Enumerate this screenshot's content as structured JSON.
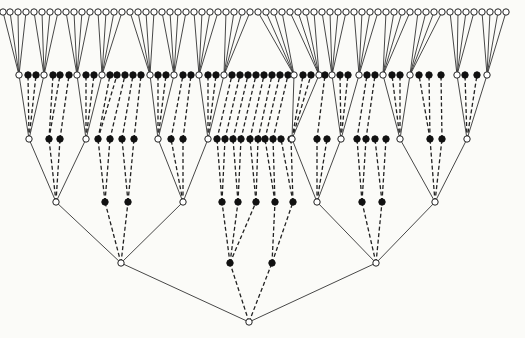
{
  "diagram": {
    "type": "tree",
    "colors": {
      "background": "#fbfbf8",
      "line": "#333333",
      "filled_node": "#111111",
      "open_node": "#ffffff"
    },
    "levels_y": [
      322,
      263,
      202,
      139,
      75,
      12
    ],
    "node_radius": 3.2,
    "root": {
      "x": 249,
      "y": 322
    },
    "level1": [
      {
        "x": 121,
        "t": "o"
      },
      {
        "x": 230,
        "t": "f"
      },
      {
        "x": 272,
        "t": "f"
      },
      {
        "x": 376,
        "t": "o"
      }
    ],
    "level2": [
      {
        "x": 56,
        "t": "o",
        "p": 0
      },
      {
        "x": 105,
        "t": "f",
        "p": 0
      },
      {
        "x": 128,
        "t": "f",
        "p": 0
      },
      {
        "x": 183,
        "t": "o",
        "p": 0
      },
      {
        "x": 222,
        "t": "f",
        "p": 1
      },
      {
        "x": 238,
        "t": "f",
        "p": 1
      },
      {
        "x": 256,
        "t": "f",
        "p": 1
      },
      {
        "x": 275,
        "t": "f",
        "p": 2
      },
      {
        "x": 293,
        "t": "f",
        "p": 2
      },
      {
        "x": 317,
        "t": "o",
        "p": 3
      },
      {
        "x": 362,
        "t": "f",
        "p": 3
      },
      {
        "x": 382,
        "t": "f",
        "p": 3
      },
      {
        "x": 435,
        "t": "o",
        "p": 3
      }
    ],
    "level3": [
      {
        "x": 29,
        "t": "o",
        "p": 0
      },
      {
        "x": 49,
        "t": "f",
        "p": 0
      },
      {
        "x": 60,
        "t": "f",
        "p": 0
      },
      {
        "x": 86,
        "t": "o",
        "p": 0
      },
      {
        "x": 98,
        "t": "f",
        "p": 1
      },
      {
        "x": 110,
        "t": "f",
        "p": 1
      },
      {
        "x": 122,
        "t": "f",
        "p": 2
      },
      {
        "x": 134,
        "t": "f",
        "p": 2
      },
      {
        "x": 158,
        "t": "o",
        "p": 3
      },
      {
        "x": 171,
        "t": "f",
        "p": 3
      },
      {
        "x": 183,
        "t": "f",
        "p": 3
      },
      {
        "x": 208,
        "t": "o",
        "p": 3
      },
      {
        "x": 217,
        "t": "f",
        "p": 4
      },
      {
        "x": 225,
        "t": "f",
        "p": 4
      },
      {
        "x": 233,
        "t": "f",
        "p": 5
      },
      {
        "x": 241,
        "t": "f",
        "p": 5
      },
      {
        "x": 250,
        "t": "f",
        "p": 6
      },
      {
        "x": 258,
        "t": "f",
        "p": 6
      },
      {
        "x": 265,
        "t": "f",
        "p": 7
      },
      {
        "x": 273,
        "t": "f",
        "p": 7
      },
      {
        "x": 281,
        "t": "f",
        "p": 8
      },
      {
        "x": 291,
        "t": "f",
        "p": 8
      },
      {
        "x": 292,
        "t": "o",
        "p": 9
      },
      {
        "x": 317,
        "t": "f",
        "p": 9
      },
      {
        "x": 327,
        "t": "f",
        "p": 9
      },
      {
        "x": 341,
        "t": "o",
        "p": 9
      },
      {
        "x": 357,
        "t": "f",
        "p": 10
      },
      {
        "x": 366,
        "t": "f",
        "p": 10
      },
      {
        "x": 375,
        "t": "f",
        "p": 11
      },
      {
        "x": 386,
        "t": "f",
        "p": 11
      },
      {
        "x": 400,
        "t": "o",
        "p": 12
      },
      {
        "x": 430,
        "t": "f",
        "p": 12
      },
      {
        "x": 442,
        "t": "f",
        "p": 12
      },
      {
        "x": 467,
        "t": "o",
        "p": 12
      }
    ],
    "level4": [
      {
        "x": 19,
        "t": "o",
        "p": 0
      },
      {
        "x": 28,
        "t": "f",
        "p": 0
      },
      {
        "x": 36,
        "t": "f",
        "p": 0
      },
      {
        "x": 44,
        "t": "o",
        "p": 0
      },
      {
        "x": 53,
        "t": "f",
        "p": 1
      },
      {
        "x": 60,
        "t": "f",
        "p": 1
      },
      {
        "x": 69,
        "t": "f",
        "p": 2
      },
      {
        "x": 77,
        "t": "o",
        "p": 3
      },
      {
        "x": 86,
        "t": "f",
        "p": 3
      },
      {
        "x": 94,
        "t": "f",
        "p": 3
      },
      {
        "x": 102,
        "t": "o",
        "p": 3
      },
      {
        "x": 110,
        "t": "f",
        "p": 4
      },
      {
        "x": 117,
        "t": "f",
        "p": 4
      },
      {
        "x": 125,
        "t": "f",
        "p": 5
      },
      {
        "x": 133,
        "t": "f",
        "p": 6
      },
      {
        "x": 141,
        "t": "f",
        "p": 7
      },
      {
        "x": 150,
        "t": "o",
        "p": 8
      },
      {
        "x": 158,
        "t": "f",
        "p": 8
      },
      {
        "x": 166,
        "t": "f",
        "p": 8
      },
      {
        "x": 174,
        "t": "o",
        "p": 8
      },
      {
        "x": 183,
        "t": "f",
        "p": 9
      },
      {
        "x": 191,
        "t": "f",
        "p": 10
      },
      {
        "x": 199,
        "t": "o",
        "p": 11
      },
      {
        "x": 208,
        "t": "f",
        "p": 11
      },
      {
        "x": 216,
        "t": "f",
        "p": 11
      },
      {
        "x": 224,
        "t": "o",
        "p": 11
      },
      {
        "x": 232,
        "t": "f",
        "p": 12
      },
      {
        "x": 240,
        "t": "f",
        "p": 13
      },
      {
        "x": 248,
        "t": "f",
        "p": 14
      },
      {
        "x": 256,
        "t": "f",
        "p": 15
      },
      {
        "x": 264,
        "t": "f",
        "p": 16
      },
      {
        "x": 272,
        "t": "f",
        "p": 17
      },
      {
        "x": 280,
        "t": "f",
        "p": 18
      },
      {
        "x": 288,
        "t": "f",
        "p": 19
      },
      {
        "x": 294,
        "t": "o",
        "p": 22
      },
      {
        "x": 303,
        "t": "f",
        "p": 22
      },
      {
        "x": 311,
        "t": "f",
        "p": 22
      },
      {
        "x": 319,
        "t": "o",
        "p": 22
      },
      {
        "x": 325,
        "t": "f",
        "p": 23
      },
      {
        "x": 332,
        "t": "o",
        "p": 25
      },
      {
        "x": 340,
        "t": "f",
        "p": 25
      },
      {
        "x": 348,
        "t": "f",
        "p": 25
      },
      {
        "x": 359,
        "t": "o",
        "p": 25
      },
      {
        "x": 367,
        "t": "f",
        "p": 26
      },
      {
        "x": 375,
        "t": "f",
        "p": 27
      },
      {
        "x": 383,
        "t": "o",
        "p": 30
      },
      {
        "x": 392,
        "t": "f",
        "p": 30
      },
      {
        "x": 400,
        "t": "f",
        "p": 30
      },
      {
        "x": 410,
        "t": "o",
        "p": 30
      },
      {
        "x": 419,
        "t": "f",
        "p": 31
      },
      {
        "x": 429,
        "t": "f",
        "p": 31
      },
      {
        "x": 441,
        "t": "f",
        "p": 32
      },
      {
        "x": 457,
        "t": "o",
        "p": 33
      },
      {
        "x": 465,
        "t": "f",
        "p": 33
      },
      {
        "x": 477,
        "t": "f",
        "p": 33
      },
      {
        "x": 487,
        "t": "o",
        "p": 33
      }
    ],
    "leaf_groups": [
      {
        "parent_x": 19,
        "xs": [
          3,
          10,
          18,
          26
        ]
      },
      {
        "parent_x": 44,
        "xs": [
          34,
          42,
          50,
          58
        ]
      },
      {
        "parent_x": 77,
        "xs": [
          66,
          74,
          82,
          90
        ]
      },
      {
        "parent_x": 102,
        "xs": [
          98,
          106,
          114,
          122
        ]
      },
      {
        "parent_x": 150,
        "xs": [
          130,
          138,
          146,
          154
        ]
      },
      {
        "parent_x": 174,
        "xs": [
          162,
          170,
          178,
          186
        ]
      },
      {
        "parent_x": 199,
        "xs": [
          194,
          202,
          210,
          218
        ]
      },
      {
        "parent_x": 224,
        "xs": [
          226,
          234,
          242,
          250
        ]
      },
      {
        "parent_x": 294,
        "xs": [
          258,
          266,
          274,
          282
        ]
      },
      {
        "parent_x": 319,
        "xs": [
          290,
          298,
          306,
          314
        ]
      },
      {
        "parent_x": 332,
        "xs": [
          322,
          330,
          338,
          346
        ]
      },
      {
        "parent_x": 359,
        "xs": [
          354,
          362,
          370,
          378
        ]
      },
      {
        "parent_x": 383,
        "xs": [
          386,
          394,
          402,
          410
        ]
      },
      {
        "parent_x": 410,
        "xs": [
          418,
          426,
          434,
          442
        ]
      },
      {
        "parent_x": 457,
        "xs": [
          450,
          458,
          466,
          474
        ]
      },
      {
        "parent_x": 487,
        "xs": [
          482,
          490,
          498,
          506
        ]
      }
    ]
  }
}
